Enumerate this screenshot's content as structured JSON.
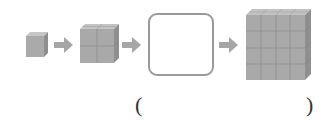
{
  "figure": {
    "sequence": [
      {
        "kind": "cube",
        "size": 1,
        "label": "1×1×1 cube"
      },
      {
        "kind": "arrow"
      },
      {
        "kind": "cube",
        "size": 2,
        "label": "2×2×2 cube"
      },
      {
        "kind": "arrow"
      },
      {
        "kind": "blank",
        "label": "missing figure"
      },
      {
        "kind": "arrow"
      },
      {
        "kind": "cube",
        "size": 4,
        "label": "4×4×4 cube"
      }
    ],
    "colors": {
      "cube_front": "#a9a9a9",
      "cube_top": "#c4c4c4",
      "cube_side": "#8f8f8f",
      "grid_line": "#8a8a8a",
      "arrow": "#a6a6a6",
      "box_border": "#9a9a9a"
    }
  },
  "answer": {
    "open_paren": "(",
    "close_paren": ")",
    "value": ""
  }
}
